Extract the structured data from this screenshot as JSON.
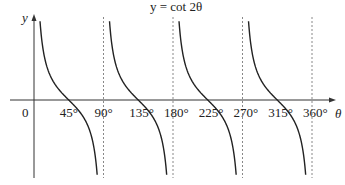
{
  "chart_data": {
    "type": "line",
    "title": "y = cot 2θ",
    "xlabel": "θ",
    "ylabel": "y",
    "origin_label": "0",
    "x_unit": "degrees",
    "xlim": [
      0,
      370
    ],
    "ylim": [
      -4,
      4
    ],
    "grid": false,
    "legend": null,
    "x_ticks": [
      {
        "value": 45,
        "label": "45°"
      },
      {
        "value": 90,
        "label": "90°"
      },
      {
        "value": 135,
        "label": "135°"
      },
      {
        "value": 180,
        "label": "180°"
      },
      {
        "value": 225,
        "label": "225°"
      },
      {
        "value": 270,
        "label": "270°"
      },
      {
        "value": 315,
        "label": "315°"
      },
      {
        "value": 360,
        "label": "360°"
      }
    ],
    "asymptotes": [
      90,
      180,
      270,
      360
    ],
    "zeros": [
      45,
      135,
      225,
      315
    ],
    "series": [
      {
        "name": "y = cot 2θ",
        "function": "cot(2θ)",
        "branches": [
          [
            0,
            90
          ],
          [
            90,
            180
          ],
          [
            180,
            270
          ],
          [
            270,
            360
          ]
        ]
      }
    ]
  },
  "labels": {
    "title": "y = cot 2θ",
    "y_axis": "y",
    "x_axis": "θ",
    "origin": "0",
    "ticks": [
      "45°",
      "90°",
      "135°",
      "180°",
      "225°",
      "270°",
      "315°",
      "360°"
    ]
  },
  "colors": {
    "curve": "#222222",
    "axis": "#333333",
    "asymptote": "#888888"
  }
}
